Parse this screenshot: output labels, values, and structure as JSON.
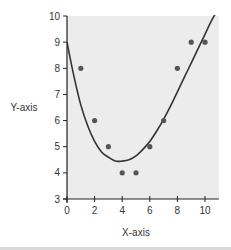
{
  "chart_data": {
    "type": "scatter",
    "title": "",
    "xlabel": "X-axis",
    "ylabel": "Y-axis",
    "xlim": [
      0,
      11
    ],
    "ylim": [
      3,
      10
    ],
    "xticks": [
      0,
      2,
      4,
      6,
      8,
      10
    ],
    "yticks": [
      3,
      4,
      5,
      6,
      7,
      8,
      9,
      10
    ],
    "grid": false,
    "legend": "none",
    "series": [
      {
        "name": "data points",
        "type": "scatter",
        "x": [
          1,
          2,
          3,
          4,
          5,
          6,
          7,
          8,
          9,
          10
        ],
        "y": [
          8,
          6,
          5,
          4,
          4,
          5,
          6,
          8,
          9,
          9
        ]
      },
      {
        "name": "fitted curve",
        "type": "line",
        "x": [
          0,
          0.5,
          1,
          1.5,
          2,
          2.5,
          3,
          3.5,
          4,
          4.5,
          5,
          5.5,
          6,
          6.5,
          7,
          7.5,
          8,
          8.5,
          9,
          9.5,
          10,
          10.5,
          11
        ],
        "y": [
          9.0,
          7.7,
          6.6,
          5.8,
          5.2,
          4.8,
          4.6,
          4.45,
          4.45,
          4.5,
          4.65,
          4.9,
          5.2,
          5.6,
          6.05,
          6.55,
          7.1,
          7.65,
          8.2,
          8.75,
          9.3,
          9.85,
          10.3
        ]
      }
    ],
    "colors": {
      "plot_background": "#ececec",
      "points": "#555555",
      "curve": "#333333",
      "axis": "#222222"
    }
  }
}
